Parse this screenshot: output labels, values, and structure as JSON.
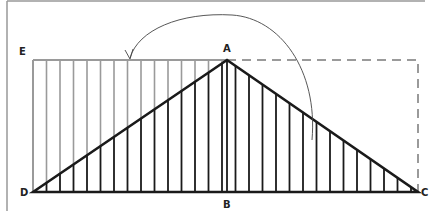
{
  "diagram": {
    "labels": {
      "A": "A",
      "B": "B",
      "C": "C",
      "D": "D",
      "E": "E"
    },
    "points": {
      "A": [
        227,
        60
      ],
      "B": [
        227,
        192
      ],
      "C": [
        418,
        192
      ],
      "D": [
        33,
        192
      ],
      "E": [
        33,
        60
      ]
    },
    "colors": {
      "triangle": "#1a1a1a",
      "rectangle": "#9a9a9a",
      "dashed": "#9a9a9a",
      "arc": "#444444",
      "frame": "#999999"
    },
    "hatch_spacing": 13.5,
    "arc": {
      "description": "Rotation arrow from right rectangle to left rectangle",
      "from": [
        312,
        140
      ],
      "to": [
        130,
        59
      ]
    }
  }
}
